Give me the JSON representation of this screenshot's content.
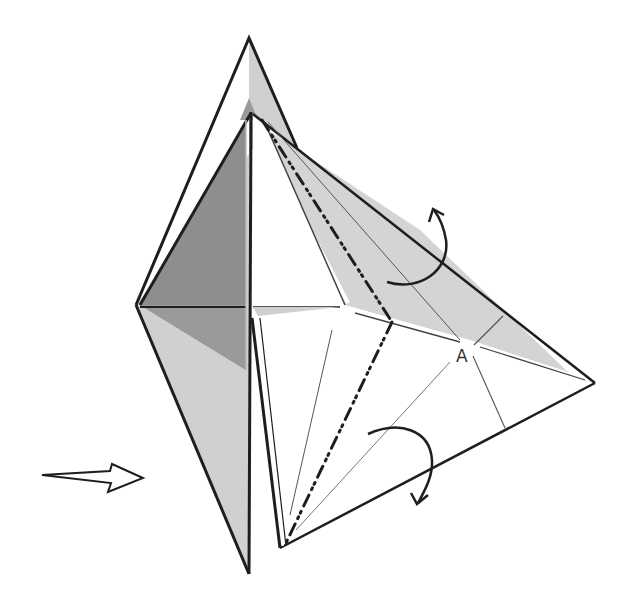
{
  "diagram": {
    "type": "origami-fold-instruction",
    "labels": {
      "point_a": "A"
    },
    "colors": {
      "background": "#ffffff",
      "paper_light": "#d4d4d4",
      "paper_mid": "#c2c2c2",
      "paper_dark": "#8e8e8e",
      "line": "#1e1e1e",
      "crease": "#555555"
    },
    "symbols": [
      {
        "name": "push-arrow",
        "meaning": "push in / sink from left"
      },
      {
        "name": "fold-behind-arrow-upper",
        "meaning": "fold flap behind (upper)"
      },
      {
        "name": "fold-behind-arrow-lower",
        "meaning": "fold flap behind (lower)"
      },
      {
        "name": "mountain-fold-line",
        "meaning": "dash-dot-dot mountain fold"
      }
    ]
  }
}
